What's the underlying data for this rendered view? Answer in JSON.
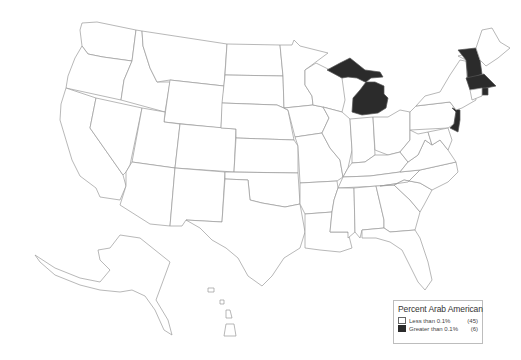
{
  "map": {
    "title": "Percent Arab American",
    "region": "United States",
    "colors": {
      "low": "#ffffff",
      "high": "#2b2b2b",
      "border": "#9a9a9a"
    },
    "shaded_states": [
      "Michigan",
      "New Hampshire",
      "Massachusetts",
      "Rhode Island",
      "New Jersey"
    ]
  },
  "legend": {
    "title": "Percent Arab American",
    "items": [
      {
        "label": "Less than 0.1%",
        "count": "(45)",
        "color": "#ffffff"
      },
      {
        "label": "Greater than 0.1%",
        "count": "(6)",
        "color": "#2b2b2b"
      }
    ]
  }
}
